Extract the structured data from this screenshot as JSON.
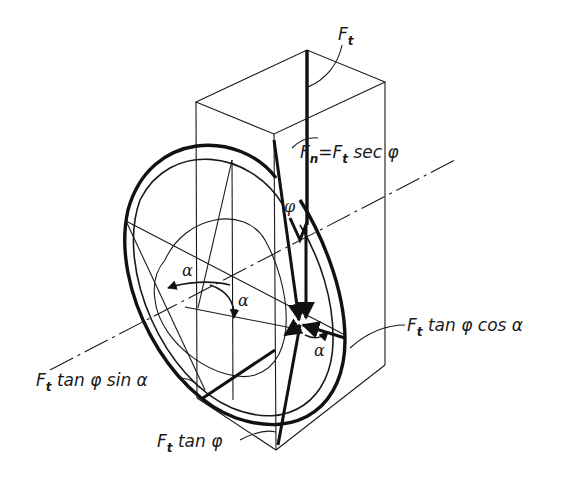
{
  "figure": {
    "labels": {
      "ft_top": {
        "main": "F",
        "sub": "t"
      },
      "fn": {
        "main": "F",
        "sub": "n",
        "eq": "=",
        "main2": "F",
        "sub2": "t",
        "rest": " sec φ"
      },
      "ft_tan_cos": {
        "main": "F",
        "sub": "t",
        "rest": " tan φ cos α"
      },
      "ft_tan_sin": {
        "main": "F",
        "sub": "t",
        "rest": " tan φ sin α"
      },
      "ft_tan": {
        "main": "F",
        "sub": "t",
        "rest": " tan φ"
      },
      "phi_angle": "φ",
      "alpha_left": "α",
      "alpha_center": "α",
      "alpha_bottom": "α"
    },
    "line_color": "#1a1a1a",
    "background": "#ffffff"
  }
}
